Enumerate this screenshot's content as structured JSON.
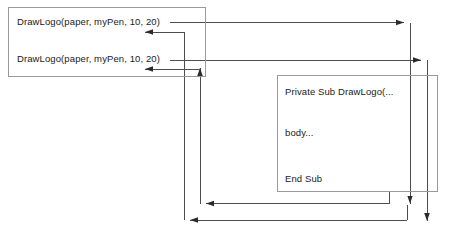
{
  "diagram": {
    "stroke_color": "#4d4d4d",
    "box_border_color": "#9a9a9a",
    "text_color": "#1a1a1a",
    "background_color": "#ffffff",
    "caller_box": {
      "name": "calling-code-box",
      "lines": [
        {
          "text": "DrawLogo(paper, myPen, 10, 20)"
        },
        {
          "text": "DrawLogo(paper, myPen, 10, 20)"
        }
      ]
    },
    "callee_box": {
      "name": "procedure-definition-box",
      "lines": [
        {
          "text": "Private Sub DrawLogo(..."
        },
        {
          "text": "body..."
        },
        {
          "text": "End Sub"
        }
      ]
    },
    "connectors": [
      {
        "name": "call-arrow-1",
        "direction": "right-then-down",
        "from": "caller-line-1",
        "to": "procedure-start"
      },
      {
        "name": "call-arrow-2",
        "direction": "right-then-down",
        "from": "caller-line-2",
        "to": "procedure-start"
      },
      {
        "name": "return-arrow-1",
        "direction": "down-then-left-then-up",
        "from": "procedure-end",
        "to": "caller-line-1"
      },
      {
        "name": "return-arrow-2",
        "direction": "down-then-left-then-up",
        "from": "procedure-end",
        "to": "caller-line-2"
      }
    ]
  }
}
